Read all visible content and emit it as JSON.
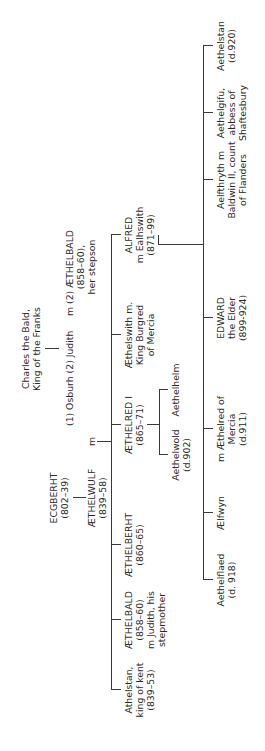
{
  "diagram": {
    "orientation": "rotated 90 degrees counter-clockwise",
    "generation_1": {
      "ecgberht": {
        "name": "ECGBERHT",
        "dates": "(802–39)"
      },
      "charles": {
        "name": "Charles the Bald,",
        "title": "King of the Franks"
      }
    },
    "generation_2": {
      "aethelwulf": {
        "name": "ÆTHELWULF",
        "dates": "(839–58)"
      },
      "marriage_m": "m",
      "wives": "(1) Osburh (2) Judith",
      "judith_m": "m",
      "aethelbald_stepson": {
        "name": "(2) ÆTHELBALD",
        "dates": "(858–60),",
        "note": "her stepson"
      }
    },
    "generation_3": [
      {
        "line1": "Athelstan,",
        "line2": "king of kent",
        "line3": "(839–53)"
      },
      {
        "line1": "ÆTHELBALD",
        "line2": "(858–60)",
        "line3": "m Judith, his",
        "line4": "stepmother"
      },
      {
        "line1": "ÆTHELBERHT",
        "line2": "(860–65)"
      },
      {
        "line1": "ÆTHELRED I",
        "line2": "(865–71)"
      },
      {
        "line1": "Æthelswith m.",
        "line2": "King Burgred",
        "line3": "of Mercia"
      },
      {
        "line1": "ALFRED",
        "line2": "m Ealhswith",
        "line3": "(871–99)"
      }
    ],
    "aethelred_children": [
      {
        "line1": "Aethelwold",
        "line2": "(d.902)"
      },
      {
        "line1": "Aethelhelm"
      }
    ],
    "alfred_children": [
      {
        "line1": "Aethelflaed",
        "line2": "(d. 918)"
      },
      {
        "line1": "Ælfwyn"
      },
      {
        "line1": "m Æthelred of",
        "line2": "Mercia",
        "line3": "(d.911)"
      },
      {
        "line1": "EDWARD",
        "line2": "the Elder",
        "line3": "(899-924)"
      },
      {
        "line1": "Aelfthryth m",
        "line2": "Baldwin II, count",
        "line3": "of Flanders"
      },
      {
        "line1": "Aethelgifu,",
        "line2": "abbess of",
        "line3": "Shaftesbury"
      },
      {
        "line1": "Aethelstan",
        "line2": "(d.920)"
      }
    ]
  }
}
